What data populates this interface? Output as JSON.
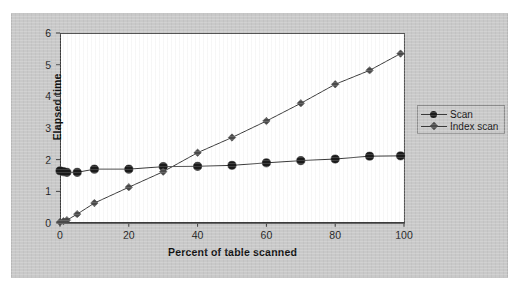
{
  "chart_data": {
    "type": "line",
    "title": "",
    "xlabel": "Percent of table scanned",
    "ylabel": "Elapsed time",
    "xlim": [
      0,
      100
    ],
    "ylim": [
      0,
      6
    ],
    "xticks": [
      "0",
      "20",
      "40",
      "60",
      "80",
      "100"
    ],
    "xtick_values": [
      0,
      20,
      40,
      60,
      80,
      100
    ],
    "yticks": [
      "0",
      "1",
      "2",
      "3",
      "4",
      "5",
      "6"
    ],
    "ytick_values": [
      0,
      1,
      2,
      3,
      4,
      5,
      6
    ],
    "grid": false,
    "legend_position": "right",
    "x": [
      0,
      1,
      2,
      5,
      10,
      20,
      30,
      40,
      50,
      60,
      70,
      80,
      90,
      99
    ],
    "series": [
      {
        "name": "Scan",
        "marker": "circle",
        "color": "#1b1b1b",
        "values": [
          1.65,
          1.62,
          1.6,
          1.6,
          1.7,
          1.7,
          1.78,
          1.79,
          1.82,
          1.9,
          1.97,
          2.02,
          2.11,
          2.12
        ]
      },
      {
        "name": "Index scan",
        "marker": "diamond",
        "color": "#4a4a4a",
        "values": [
          0.03,
          0.06,
          0.09,
          0.28,
          0.63,
          1.13,
          1.62,
          2.22,
          2.7,
          3.22,
          3.78,
          4.38,
          4.82,
          5.35
        ]
      }
    ]
  },
  "legend": {
    "items": [
      {
        "label": "Scan"
      },
      {
        "label": "Index scan"
      }
    ]
  },
  "axes": {
    "y_label": "Elapsed time",
    "x_label": "Percent of table scanned"
  }
}
